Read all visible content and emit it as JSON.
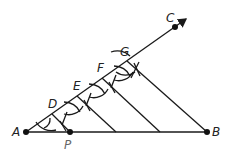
{
  "diagram": {
    "title": "",
    "points": {
      "A": {
        "label": "A"
      },
      "B": {
        "label": "B"
      },
      "C": {
        "label": "C"
      },
      "D": {
        "label": "D"
      },
      "E": {
        "label": "E"
      },
      "F": {
        "label": "F"
      },
      "G": {
        "label": "G"
      },
      "P": {
        "label": "P"
      }
    },
    "colors": {
      "line": "#1a1a1a",
      "point": "#111111",
      "label_p": "#666666"
    }
  }
}
